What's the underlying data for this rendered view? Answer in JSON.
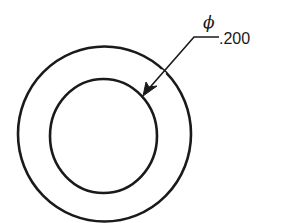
{
  "diagram": {
    "type": "engineering-drawing",
    "colors": {
      "line": "#1a1a1a",
      "background": "#ffffff"
    },
    "outer_circle": {
      "cx": 104.5,
      "cy": 134,
      "rx": 86.5,
      "ry": 87.5
    },
    "inner_circle": {
      "cx": 103.5,
      "cy": 136,
      "rx": 53.5,
      "ry": 57
    },
    "leader": {
      "shoulder": {
        "x1": 194,
        "y1": 37,
        "x2": 219,
        "y2": 37
      },
      "arrow_tip": {
        "x": 143,
        "y": 95
      }
    },
    "dimension": {
      "symbol": "ϕ",
      "value": ".200"
    }
  }
}
